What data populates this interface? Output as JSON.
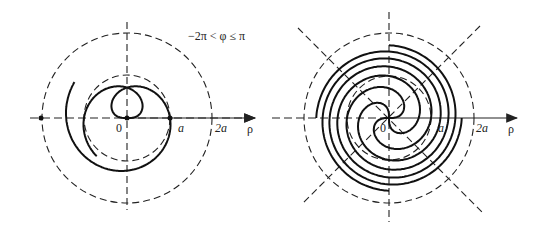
{
  "figures": [
    {
      "id": "left",
      "origin": [
        127,
        118
      ],
      "a_px": 43,
      "range_label": "−2π < φ ≤ π",
      "phi_min": -6.2832,
      "phi_max": 3.1416,
      "labels": {
        "origin": "0",
        "a": "a",
        "two_a": "2a",
        "rho": "ρ"
      },
      "axis": {
        "x_from": 30,
        "x_to": 255,
        "y_from": 22,
        "y_to": 210
      },
      "diagonals": false,
      "arms": 1
    },
    {
      "id": "right",
      "origin": [
        389,
        118
      ],
      "a_px": 42,
      "labels": {
        "origin": "0",
        "a": "a",
        "two_a": "2a",
        "rho": "ρ"
      },
      "axis": {
        "x_from": 272,
        "x_to": 517,
        "y_from": 12,
        "y_to": 222
      },
      "diagonals": true,
      "arms": 4
    }
  ],
  "curve_hint": "Fermat-type spiral ρ² = a²φ with dashed reference circles ρ = a and ρ = 2a"
}
